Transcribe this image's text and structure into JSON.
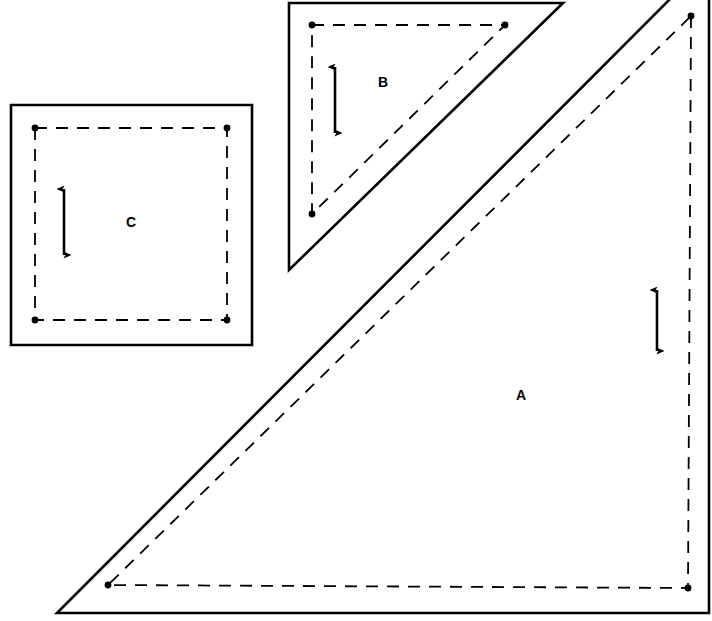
{
  "canvas": {
    "width": 712,
    "height": 621,
    "background": "#ffffff",
    "stroke_color": "#000000",
    "solid_stroke_width": 2.6,
    "dashed_stroke_width": 1.8,
    "dot_radius": 3.4
  },
  "pieces": [
    {
      "id": "piece-a",
      "label": "A",
      "label_x": 521,
      "label_y": 396,
      "shape": "right-triangle",
      "cut_outline_points": "709,-40 709,613 57,613 709,-40",
      "seam_outline_points": "691,16 688,588 108,585 691,16",
      "seam_dots": [
        {
          "x": 691,
          "y": 16
        },
        {
          "x": 688,
          "y": 588
        },
        {
          "x": 108,
          "y": 585
        }
      ],
      "grain_arrow": {
        "x": 657,
        "y_top": 283,
        "y_bottom": 358
      }
    },
    {
      "id": "piece-b",
      "label": "B",
      "label_x": 383,
      "label_y": 83,
      "shape": "right-triangle",
      "cut_outline_points": "289,3 563,3 289,270 289,3",
      "seam_outline_points": "312,25 505,25 312,214 312,25",
      "seam_dots": [
        {
          "x": 312,
          "y": 25
        },
        {
          "x": 505,
          "y": 25
        },
        {
          "x": 312,
          "y": 214
        }
      ],
      "grain_arrow": {
        "x": 335,
        "y_top": 60,
        "y_bottom": 140
      }
    },
    {
      "id": "piece-c",
      "label": "C",
      "label_x": 131,
      "label_y": 223,
      "shape": "square",
      "cut_outline_points": "11,105 252,105 252,345 11,345 11,105",
      "seam_outline_points": "35,128 227,128 227,320 35,320 35,128",
      "seam_dots": [
        {
          "x": 35,
          "y": 128
        },
        {
          "x": 227,
          "y": 128
        },
        {
          "x": 227,
          "y": 320
        },
        {
          "x": 35,
          "y": 320
        }
      ],
      "grain_arrow": {
        "x": 64,
        "y_top": 182,
        "y_bottom": 262
      }
    }
  ]
}
